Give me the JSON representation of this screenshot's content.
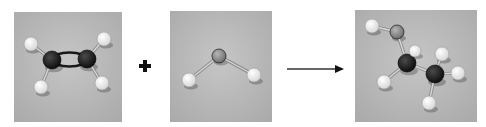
{
  "figure": {
    "operator_plus": "+",
    "arrow": "reaction-arrow"
  },
  "colors": {
    "background": "#ffffff",
    "photo_bg": "#b9b9b9",
    "carbon": "#1a1a1a",
    "hydrogen": "#f2f2f2",
    "oxygen": "#8e8e8e",
    "bond": "#d8d8d8",
    "ink": "#111111"
  },
  "panels": [
    {
      "id": "ethene",
      "label": "ethene model",
      "box": [
        14,
        12,
        108,
        110
      ],
      "atoms": [
        {
          "el": "C",
          "x": 38,
          "y": 48,
          "r": 9
        },
        {
          "el": "C",
          "x": 73,
          "y": 47,
          "r": 9
        },
        {
          "el": "H",
          "x": 17,
          "y": 32,
          "r": 7
        },
        {
          "el": "H",
          "x": 90,
          "y": 27,
          "r": 7
        },
        {
          "el": "H",
          "x": 27,
          "y": 75,
          "r": 7
        },
        {
          "el": "H",
          "x": 88,
          "y": 71,
          "r": 7
        }
      ],
      "bonds": [
        [
          0,
          2
        ],
        [
          1,
          3
        ],
        [
          0,
          4
        ],
        [
          1,
          5
        ]
      ],
      "double_bond": [
        0,
        1
      ]
    },
    {
      "id": "water",
      "label": "water model",
      "box": [
        170,
        11,
        102,
        111
      ],
      "atoms": [
        {
          "el": "O",
          "x": 49,
          "y": 45,
          "r": 7
        },
        {
          "el": "H",
          "x": 19,
          "y": 69,
          "r": 7
        },
        {
          "el": "H",
          "x": 84,
          "y": 64,
          "r": 7
        }
      ],
      "bonds": [
        [
          0,
          1
        ],
        [
          0,
          2
        ]
      ]
    },
    {
      "id": "ethanol",
      "label": "ethanol model",
      "box": [
        355,
        10,
        122,
        112
      ],
      "atoms": [
        {
          "el": "H",
          "x": 17,
          "y": 16,
          "r": 7
        },
        {
          "el": "O",
          "x": 42,
          "y": 22,
          "r": 7
        },
        {
          "el": "C",
          "x": 52,
          "y": 53,
          "r": 9
        },
        {
          "el": "H",
          "x": 60,
          "y": 41,
          "r": 6
        },
        {
          "el": "H",
          "x": 29,
          "y": 72,
          "r": 7
        },
        {
          "el": "C",
          "x": 80,
          "y": 64,
          "r": 9
        },
        {
          "el": "H",
          "x": 87,
          "y": 44,
          "r": 7
        },
        {
          "el": "H",
          "x": 103,
          "y": 63,
          "r": 7
        },
        {
          "el": "H",
          "x": 74,
          "y": 93,
          "r": 7
        }
      ],
      "bonds": [
        [
          0,
          1
        ],
        [
          1,
          2
        ],
        [
          2,
          3
        ],
        [
          2,
          4
        ],
        [
          2,
          5
        ],
        [
          5,
          6
        ],
        [
          5,
          7
        ],
        [
          5,
          8
        ]
      ]
    }
  ]
}
